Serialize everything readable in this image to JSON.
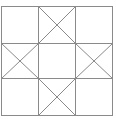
{
  "diagram": {
    "type": "quilt-block-grid",
    "grid": {
      "rows": 3,
      "cols": 3
    },
    "line_color": "#8a8a8a",
    "background": "#ffffff",
    "crossed_cells": [
      [
        0,
        1
      ],
      [
        1,
        0
      ],
      [
        1,
        2
      ],
      [
        2,
        1
      ]
    ]
  }
}
